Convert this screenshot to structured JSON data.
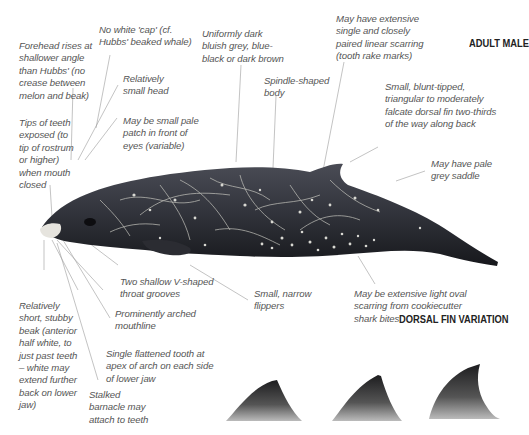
{
  "titles": {
    "main": "ADULT MALE",
    "fin_variation": "DORSAL FIN VARIATION"
  },
  "annotations": {
    "no_white_cap": "No white 'cap' (cf.\nHubbs' beaked whale)",
    "forehead": "Forehead rises at\nshallower angle\nthan Hubbs' (no\ncrease between\nmelon and beak)",
    "small_head": "Relatively\nsmall head",
    "coloration": "Uniformly dark\nbluish grey, blue-\nblack or dark brown",
    "rake_marks": "May have extensive\nsingle and closely\npaired linear scarring\n(tooth rake marks)",
    "spindle_body": "Spindle-shaped\nbody",
    "dorsal_fin": "Small, blunt-tipped,\ntriangular to moderately\nfalcate dorsal fin two-thirds\nof the way along back",
    "pale_patch": "May be small pale\npatch in front of\neyes (variable)",
    "teeth_exposed": "Tips of teeth\nexposed (to\ntip of rostrum\nor higher)\nwhen mouth\nclosed",
    "grey_saddle": "May have pale\ngrey saddle",
    "throat_grooves": "Two shallow V-shaped\nthroat grooves",
    "mouthline": "Prominently arched\nmouthline",
    "beak": "Relatively\nshort, stubby\nbeak (anterior\nhalf white, to\njust past teeth\n– white may\nextend further\nback on lower\njaw)",
    "tooth": "Single flattened tooth at\napex of arch on each side\nof lower jaw",
    "barnacle": "Stalked\nbarnacle may\nattach to teeth",
    "flippers": "Small, narrow\nflippers",
    "cookiecutter": "May be extensive light oval\nscarring from cookiecutter\nshark bites"
  },
  "colors": {
    "body_dark": "#1e1f24",
    "body_mid": "#3a3c44",
    "scar": "#c9c9c2",
    "leader": "#8a8a8a",
    "beak_white": "#e8e6e0"
  }
}
